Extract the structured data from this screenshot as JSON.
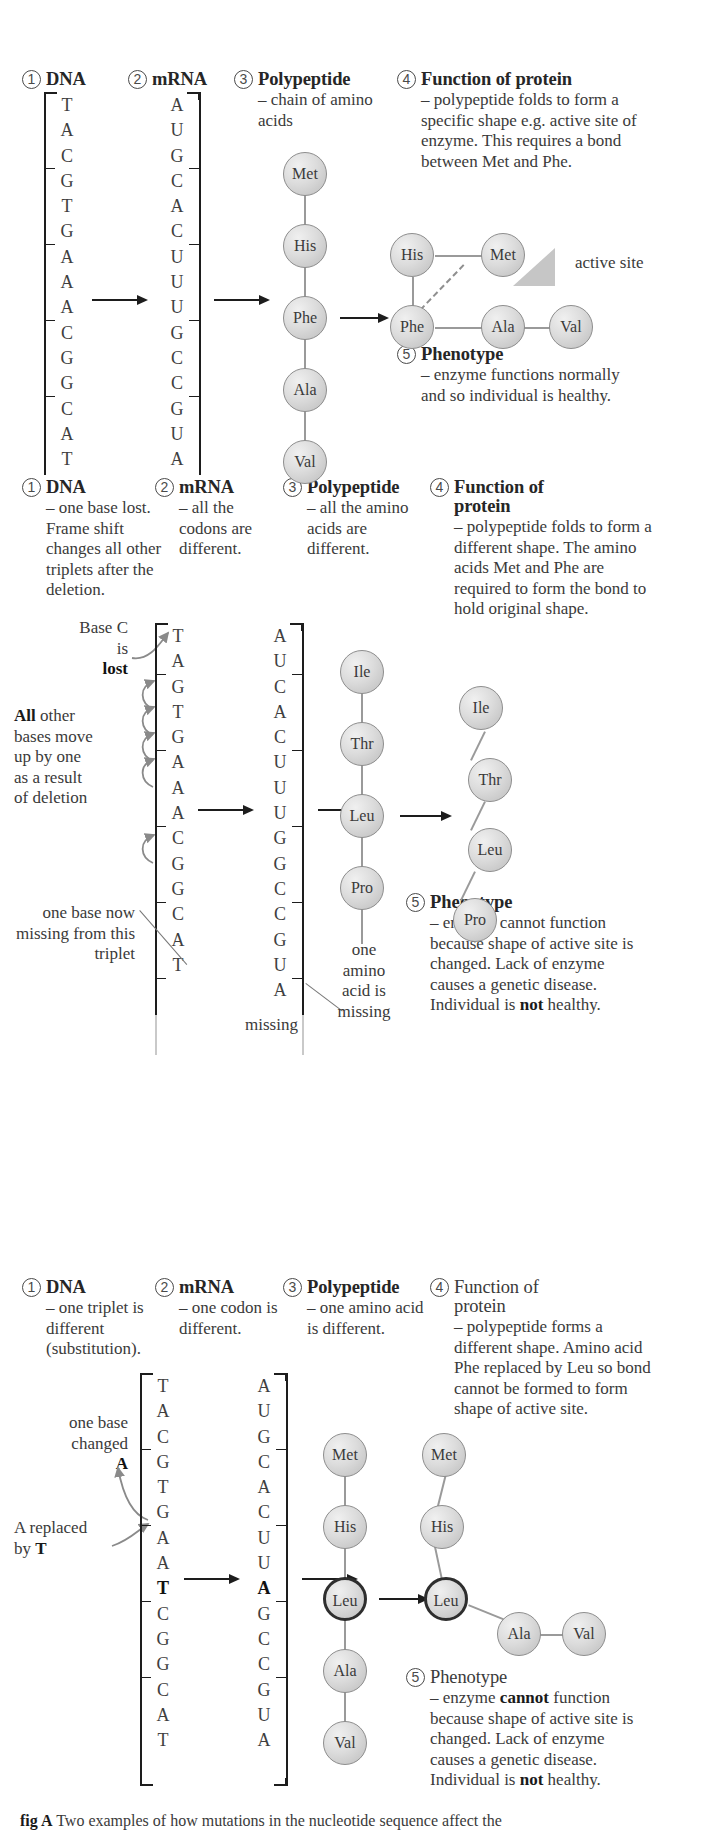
{
  "panels": [
    {
      "id": "normal",
      "steps": [
        {
          "num": "1",
          "title": "DNA",
          "bold": true,
          "body": ""
        },
        {
          "num": "2",
          "title": "mRNA",
          "bold": true,
          "body": ""
        },
        {
          "num": "3",
          "title": "Polypeptide",
          "bold": true,
          "body": "– chain of amino acids"
        },
        {
          "num": "4",
          "title": "Function of protein",
          "bold": true,
          "body": "– polypeptide folds to form a specific shape e.g. active site of enzyme. This requires a bond between Met and Phe."
        },
        {
          "num": "5",
          "title": "Phenotype",
          "bold": true,
          "body": "– enzyme functions normally and so individual is healthy."
        }
      ],
      "dna_bases": [
        "T",
        "A",
        "C",
        "G",
        "T",
        "G",
        "A",
        "A",
        "A",
        "C",
        "G",
        "G",
        "C",
        "A",
        "T"
      ],
      "dna_triplets": [
        "TAC",
        "GTG",
        "AAA",
        "CGG",
        "CAT"
      ],
      "mrna_bases": [
        "A",
        "U",
        "G",
        "C",
        "A",
        "C",
        "U",
        "U",
        "U",
        "G",
        "C",
        "C",
        "G",
        "U",
        "A"
      ],
      "mrna_codons": [
        "AUG",
        "CAC",
        "UUU",
        "GCC",
        "GUA"
      ],
      "polypeptide": [
        "Met",
        "His",
        "Phe",
        "Ala",
        "Val"
      ],
      "folded": [
        "His",
        "Met",
        "Phe",
        "Ala",
        "Val"
      ],
      "active_site_label": "active site"
    },
    {
      "id": "deletion",
      "steps": [
        {
          "num": "1",
          "title": "DNA",
          "bold": true,
          "body": "– one base lost. Frame shift changes all other triplets after the deletion."
        },
        {
          "num": "2",
          "title": "mRNA",
          "bold": true,
          "body": "– all the codons are different."
        },
        {
          "num": "3",
          "title": "Polypeptide",
          "bold": true,
          "body": "– all the amino acids are different."
        },
        {
          "num": "4",
          "title": "Function of protein",
          "bold": true,
          "body": "– polypeptide folds to form a different shape. The amino acids Met and Phe are required to form the bond to hold original shape."
        },
        {
          "num": "5",
          "title": "Phenotype",
          "bold": true,
          "body": "– enzyme cannot function because shape of active site is changed. Lack of enzyme causes a genetic disease. Individual is not healthy."
        }
      ],
      "dna_bases": [
        "T",
        "A",
        "G",
        "T",
        "G",
        "A",
        "A",
        "A",
        "C",
        "G",
        "G",
        "C",
        "A",
        "T"
      ],
      "dna_triplets": [
        "TAG",
        "TGA",
        "AAC",
        "GGC",
        "AT"
      ],
      "mrna_bases": [
        "A",
        "U",
        "C",
        "A",
        "C",
        "U",
        "U",
        "U",
        "G",
        "G",
        "C",
        "C",
        "G",
        "U",
        "A"
      ],
      "mrna_codons": [
        "AUC",
        "ACU",
        "UUG",
        "GCC",
        "GUA"
      ],
      "polypeptide": [
        "Ile",
        "Thr",
        "Leu",
        "Pro"
      ],
      "folded": [
        "Ile",
        "Thr",
        "Leu",
        "Pro"
      ],
      "annotations": {
        "base_lost_line1": "Base C",
        "base_lost_line2": "is",
        "base_lost_line3": "lost",
        "all_move_line1": "All",
        "all_move_rest": " other",
        "all_move_line2": "bases move",
        "all_move_line3": "up by one",
        "all_move_line4": "as a result",
        "all_move_line5": "of deletion",
        "one_base_missing": "one base now missing from this triplet",
        "missing": "missing",
        "one_amino_missing": "one amino acid is missing"
      }
    },
    {
      "id": "substitution",
      "steps": [
        {
          "num": "1",
          "title": "DNA",
          "bold": true,
          "body": "– one triplet is different (substitution)."
        },
        {
          "num": "2",
          "title": "mRNA",
          "bold": true,
          "body": "– one codon is different."
        },
        {
          "num": "3",
          "title": "Polypeptide",
          "bold": true,
          "body": "– one amino acid is different."
        },
        {
          "num": "4",
          "title": "Function of protein",
          "bold": false,
          "body": "– polypeptide forms a different shape. Amino acid Phe replaced by Leu so bond cannot be formed to form shape of active site."
        },
        {
          "num": "5",
          "title": "Phenotype",
          "bold": false,
          "body": "– enzyme cannot function because shape of active site is changed. Lack of enzyme causes a genetic disease. Individual is not healthy."
        }
      ],
      "dna_bases": [
        "T",
        "A",
        "C",
        "G",
        "T",
        "G",
        "A",
        "A",
        "T",
        "C",
        "G",
        "G",
        "C",
        "A",
        "T"
      ],
      "dna_bold_index": 8,
      "dna_triplets": [
        "TAC",
        "GTG",
        "AAT",
        "CGG",
        "CAT"
      ],
      "mrna_bases": [
        "A",
        "U",
        "G",
        "C",
        "A",
        "C",
        "U",
        "U",
        "A",
        "G",
        "C",
        "C",
        "G",
        "U",
        "A"
      ],
      "mrna_bold_index": 8,
      "mrna_codons": [
        "AUG",
        "CAC",
        "UUA",
        "GCC",
        "GUA"
      ],
      "polypeptide": [
        "Met",
        "His",
        "Leu",
        "Ala",
        "Val"
      ],
      "folded": [
        "Met",
        "His",
        "Leu",
        "Ala",
        "Val"
      ],
      "annotations": {
        "one_base_changed_l1": "one base",
        "one_base_changed_l2": "changed",
        "one_base_changed_l3": "A",
        "a_replaced_l1": "A replaced",
        "a_replaced_l2_pre": "by ",
        "a_replaced_l2_bold": "T"
      }
    }
  ],
  "caption": {
    "fig": "fig A",
    "text": "Two examples of how mutations in the nucleotide sequence affect the"
  },
  "colors": {
    "ink": "#3a3a3a",
    "heading": "#262626",
    "circle_border": "#8d8d8d",
    "bond": "#9a9a9a",
    "active_site": "#c6c6c6"
  }
}
